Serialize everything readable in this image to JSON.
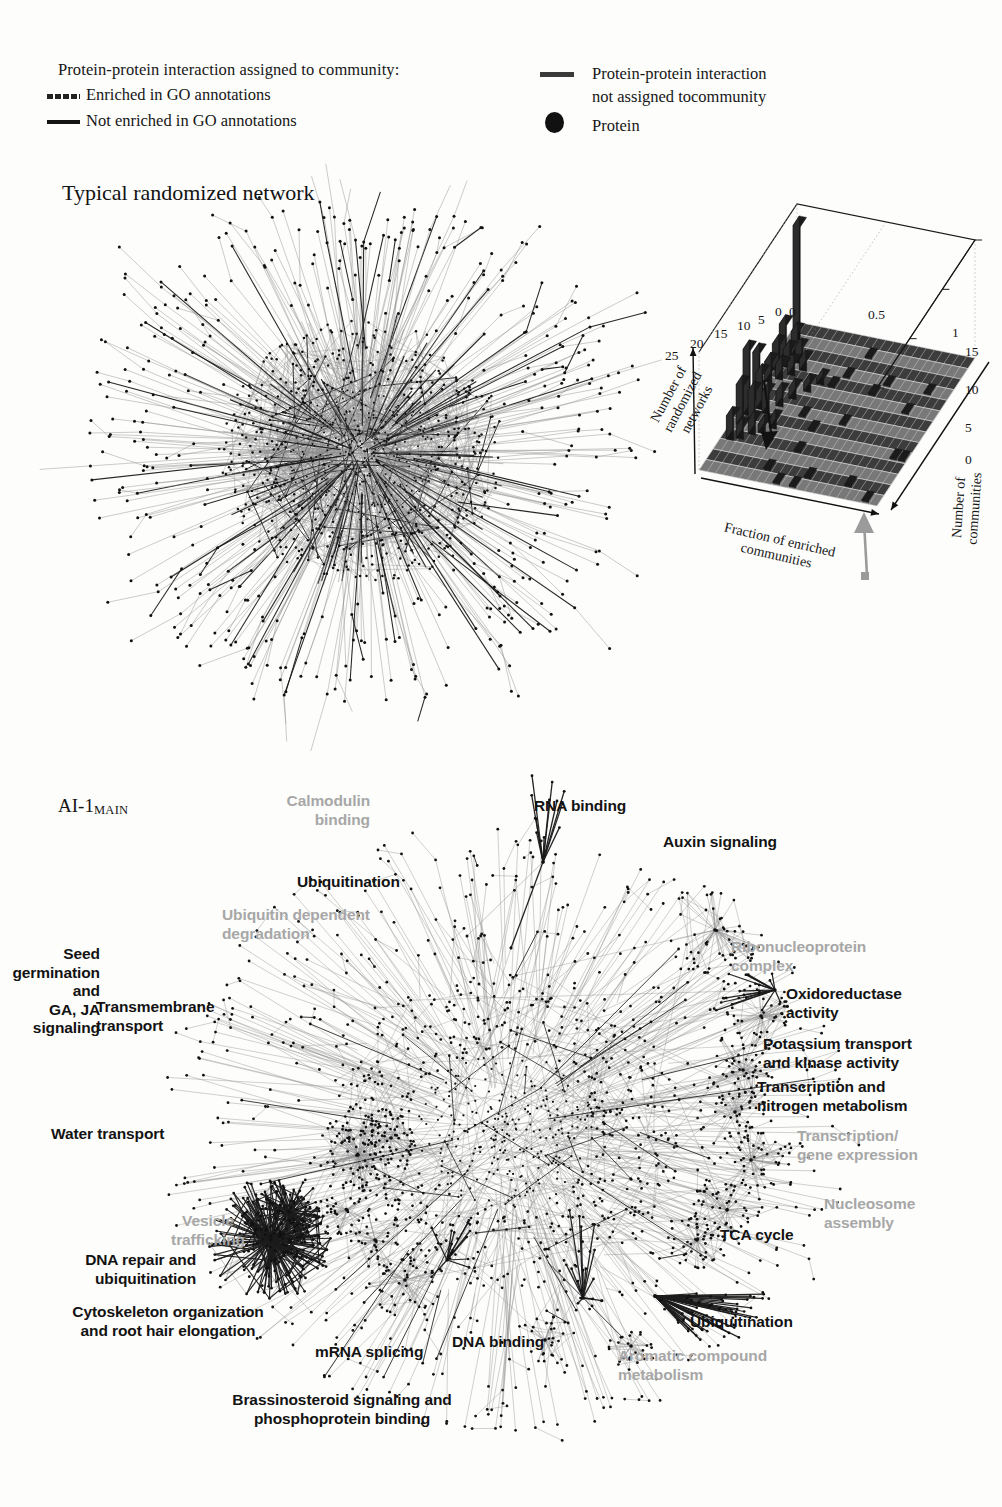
{
  "legend": {
    "title": "Protein-protein interaction assigned to community:",
    "enriched_label": "Enriched in GO annotations",
    "not_enriched_label": "Not enriched in GO annotations",
    "unassigned_label": "Protein-protein interaction\nnot assigned tocommunity",
    "protein_label": "Protein",
    "swatch_enriched": "dashed-line-swatch",
    "swatch_not_enriched": "solid-line-swatch",
    "swatch_unassigned": "solid-line-swatch",
    "swatch_protein": "filled-circle-swatch"
  },
  "panels": {
    "random_title": "Typical randomized network",
    "main_title": "AI-1",
    "main_title_sub": "MAIN"
  },
  "chart_data": {
    "type": "surface",
    "title": "",
    "xlabel": "Fraction of enriched\ncommunities",
    "ylabel": "Number of\ncommunities",
    "zlabel": "Number of\nrandomized\nnetworks",
    "x_ticks": [
      "0",
      "0.5",
      "1"
    ],
    "y_ticks": [
      "0",
      "5",
      "10",
      "15"
    ],
    "z_ticks": [
      "0",
      "5",
      "10",
      "15",
      "20",
      "25"
    ],
    "xlim": [
      0,
      1
    ],
    "ylim": [
      0,
      15
    ],
    "zlim": [
      0,
      25
    ],
    "grid": true,
    "annotations": [
      {
        "name": "peak-arrow",
        "text": ""
      },
      {
        "name": "baseline-arrow",
        "text": ""
      }
    ]
  },
  "random_network": {
    "name": "typical-randomized-network",
    "nodes": 1100,
    "hub_count": 1,
    "description": "dense radial hairball, gray edges with scattered black community edges"
  },
  "main_network": {
    "name": "ai1-main-network",
    "nodes": 1400,
    "description": "large community-structured interactome with labeled modules"
  },
  "annotations": [
    {
      "id": "calmodulin",
      "text": "Calmodulin\nbinding",
      "color": "gray",
      "align": "right",
      "x": 370,
      "y": 792
    },
    {
      "id": "rna-binding",
      "text": "RNA binding",
      "color": "black",
      "align": "left",
      "x": 534,
      "y": 797
    },
    {
      "id": "auxin",
      "text": "Auxin signaling",
      "color": "black",
      "align": "left",
      "x": 663,
      "y": 833
    },
    {
      "id": "ubiquitination-1",
      "text": "Ubiquitination",
      "color": "black",
      "align": "left",
      "x": 297,
      "y": 873
    },
    {
      "id": "ubi-dep-deg",
      "text": "Ubiquitin dependent\ndegradation",
      "color": "gray",
      "align": "left",
      "x": 222,
      "y": 906
    },
    {
      "id": "ribonucleo",
      "text": "Ribonucleoprotein\ncomplex",
      "color": "gray",
      "align": "left",
      "x": 731,
      "y": 938
    },
    {
      "id": "seed-germ",
      "text": "Seed germination and\nGA, JA signaling",
      "color": "black",
      "align": "right",
      "x": 100,
      "y": 945
    },
    {
      "id": "oxidoreductase",
      "text": "Oxidoreductase\nactivity",
      "color": "black",
      "align": "left",
      "x": 786,
      "y": 985
    },
    {
      "id": "transmembrane",
      "text": "Transmembrane\ntransport",
      "color": "black",
      "align": "left",
      "x": 96,
      "y": 998
    },
    {
      "id": "potassium",
      "text": "Potassium transport\nand kinase activity",
      "color": "black",
      "align": "left",
      "x": 763,
      "y": 1035
    },
    {
      "id": "transcription-n",
      "text": "Transcription and\nnitrogen metabolism",
      "color": "black",
      "align": "left",
      "x": 757,
      "y": 1078
    },
    {
      "id": "water-transport",
      "text": "Water transport",
      "color": "black",
      "align": "left",
      "x": 51,
      "y": 1125
    },
    {
      "id": "transcr-gene",
      "text": "Transcription/\ngene expression",
      "color": "gray",
      "align": "left",
      "x": 797,
      "y": 1127
    },
    {
      "id": "vesicle",
      "text": "Vesicle\ntrafficking",
      "color": "gray",
      "align": "center",
      "x": 208,
      "y": 1212
    },
    {
      "id": "nucleosome",
      "text": "Nucleosome\nassembly",
      "color": "gray",
      "align": "left",
      "x": 824,
      "y": 1195
    },
    {
      "id": "tca",
      "text": "TCA cycle",
      "color": "black",
      "align": "left",
      "x": 720,
      "y": 1226
    },
    {
      "id": "dna-repair",
      "text": "DNA repair and\nubiquitination",
      "color": "black",
      "align": "right",
      "x": 196,
      "y": 1251
    },
    {
      "id": "cytoskeleton",
      "text": "Cytoskeleton organization\nand root hair elongation",
      "color": "black",
      "align": "center",
      "x": 168,
      "y": 1303
    },
    {
      "id": "ubiquitination-2",
      "text": "Ubiquitination",
      "color": "black",
      "align": "left",
      "x": 690,
      "y": 1313
    },
    {
      "id": "mrna-splicing",
      "text": "mRNA splicing",
      "color": "black",
      "align": "left",
      "x": 315,
      "y": 1343
    },
    {
      "id": "dna-binding",
      "text": "DNA binding",
      "color": "black",
      "align": "left",
      "x": 452,
      "y": 1333
    },
    {
      "id": "aromatic",
      "text": "Aromatic compound\nmetabolism",
      "color": "gray",
      "align": "left",
      "x": 618,
      "y": 1347
    },
    {
      "id": "brassinosteroid",
      "text": "Brassinosteroid signaling and\nphosphoprotein binding",
      "color": "black",
      "align": "center",
      "x": 342,
      "y": 1391
    }
  ],
  "colors": {
    "ink": "#131313",
    "gray_label": "#a7a7a7",
    "edge_gray": "#8d8d8d",
    "edge_black": "#1c1c1c",
    "node": "#111111",
    "background": "#fdfdfc"
  }
}
